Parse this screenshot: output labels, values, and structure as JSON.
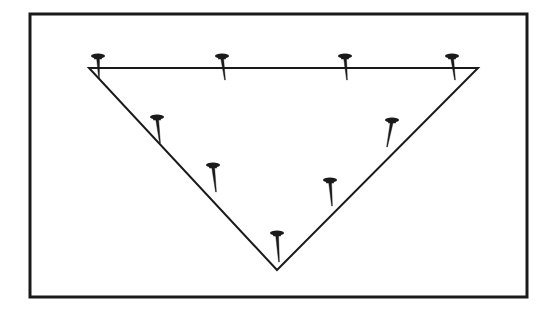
{
  "figure": {
    "canvas": {
      "width": 552,
      "height": 319
    },
    "background_color": "#ffffff",
    "ink_color": "#1a1a1a",
    "frame": {
      "name": "outer-rectangle-border",
      "x": 30,
      "y": 14,
      "width": 497,
      "height": 283,
      "stroke_width": 3,
      "stroke_color": "#1a1a1a",
      "fill": "none"
    },
    "triangle": {
      "name": "inverted-triangle",
      "orientation": "point-down",
      "stroke_width": 2,
      "stroke_color": "#1a1a1a",
      "fill": "none",
      "vertices": [
        {
          "label": "top-left",
          "x": 89,
          "y": 68
        },
        {
          "label": "top-right",
          "x": 478,
          "y": 68
        },
        {
          "label": "bottom-apex",
          "x": 277,
          "y": 270
        }
      ],
      "edges": [
        {
          "label": "top-edge",
          "from": "top-left",
          "to": "top-right"
        },
        {
          "label": "left-edge",
          "from": "top-left",
          "to": "bottom-apex"
        },
        {
          "label": "right-edge",
          "from": "top-right",
          "to": "bottom-apex"
        }
      ]
    },
    "nails": [
      {
        "id": 1,
        "label": "nail-top-edge-1",
        "edge": "top-edge",
        "head_x": 98,
        "head_y": 56,
        "tip_x": 99,
        "tip_y": 78,
        "head_rx": 7,
        "head_ry": 2.6
      },
      {
        "id": 2,
        "label": "nail-top-edge-2",
        "edge": "top-edge",
        "head_x": 222,
        "head_y": 56,
        "tip_x": 225,
        "tip_y": 80,
        "head_rx": 7,
        "head_ry": 2.6
      },
      {
        "id": 3,
        "label": "nail-top-edge-3",
        "edge": "top-edge",
        "head_x": 345,
        "head_y": 56,
        "tip_x": 347,
        "tip_y": 80,
        "head_rx": 7,
        "head_ry": 2.6
      },
      {
        "id": 4,
        "label": "nail-top-edge-4",
        "edge": "top-edge",
        "head_x": 452,
        "head_y": 56,
        "tip_x": 455,
        "tip_y": 80,
        "head_rx": 7,
        "head_ry": 2.6
      },
      {
        "id": 5,
        "label": "nail-left-edge-upper",
        "edge": "left-edge",
        "head_x": 157,
        "head_y": 117,
        "tip_x": 160,
        "tip_y": 143,
        "head_rx": 7,
        "head_ry": 2.6
      },
      {
        "id": 6,
        "label": "nail-left-edge-lower",
        "edge": "left-edge",
        "head_x": 213,
        "head_y": 165,
        "tip_x": 216,
        "tip_y": 192,
        "head_rx": 7,
        "head_ry": 2.6
      },
      {
        "id": 7,
        "label": "nail-bottom-apex",
        "edge": "apex",
        "head_x": 277,
        "head_y": 233,
        "tip_x": 279,
        "tip_y": 262,
        "head_rx": 7,
        "head_ry": 2.6
      },
      {
        "id": 8,
        "label": "nail-right-edge-lower",
        "edge": "right-edge",
        "head_x": 330,
        "head_y": 180,
        "tip_x": 332,
        "tip_y": 206,
        "head_rx": 7,
        "head_ry": 2.6
      },
      {
        "id": 9,
        "label": "nail-right-edge-upper",
        "edge": "right-edge",
        "head_x": 392,
        "head_y": 120,
        "tip_x": 387,
        "tip_y": 147,
        "head_rx": 7,
        "head_ry": 2.6
      }
    ]
  }
}
